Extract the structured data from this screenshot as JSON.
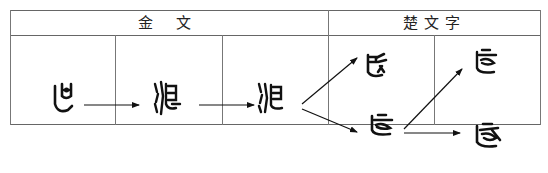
{
  "table": {
    "header": {
      "jinwen_label": "金 文",
      "chu_label": "楚文字"
    },
    "columns": [
      {
        "group": "金文",
        "glyphs": [
          {
            "id": "g1",
            "char": "𠃊",
            "desc": "early bronze form"
          }
        ]
      },
      {
        "group": "金文",
        "glyphs": [
          {
            "id": "g2",
            "char": "ᒪ",
            "desc": "bronze form with water radical"
          }
        ]
      },
      {
        "group": "金文",
        "glyphs": [
          {
            "id": "g3",
            "char": "ᒪ",
            "desc": "later bronze form"
          }
        ]
      },
      {
        "group": "楚文字",
        "glyphs": [
          {
            "id": "g4",
            "char": "ᒪ",
            "desc": "Chu form (upper)"
          },
          {
            "id": "g5",
            "char": "ᒪ",
            "desc": "Chu form (lower)"
          }
        ]
      },
      {
        "group": "楚文字",
        "glyphs": [
          {
            "id": "g6",
            "char": "ᒪ",
            "desc": "Chu form (upper)"
          },
          {
            "id": "g7",
            "char": "ᒪ",
            "desc": "Chu form (lower)"
          }
        ]
      }
    ],
    "arrows": [
      {
        "from": "g1",
        "to": "g2"
      },
      {
        "from": "g2",
        "to": "g3"
      },
      {
        "from": "g3",
        "to": "g4"
      },
      {
        "from": "g3",
        "to": "g5"
      },
      {
        "from": "g5",
        "to": "g6"
      },
      {
        "from": "g5",
        "to": "g7"
      }
    ]
  },
  "colors": {
    "border": "#666666",
    "ink": "#111111",
    "background": "#ffffff"
  }
}
